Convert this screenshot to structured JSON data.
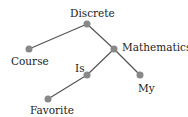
{
  "diagram": {
    "type": "tree",
    "edge_color": "#555555",
    "node_color": "#888888",
    "nodes": [
      {
        "id": "discrete",
        "label": "Discrete",
        "x": 87,
        "y": 24
      },
      {
        "id": "course",
        "label": "Course",
        "x": 29,
        "y": 49
      },
      {
        "id": "mathematics",
        "label": "Mathematics",
        "x": 114,
        "y": 49
      },
      {
        "id": "is",
        "label": "Is",
        "x": 87,
        "y": 75
      },
      {
        "id": "my",
        "label": "My",
        "x": 140,
        "y": 75
      },
      {
        "id": "favorite",
        "label": "Favorite",
        "x": 48,
        "y": 99
      }
    ],
    "edges": [
      [
        "discrete",
        "course"
      ],
      [
        "discrete",
        "mathematics"
      ],
      [
        "mathematics",
        "is"
      ],
      [
        "mathematics",
        "my"
      ],
      [
        "is",
        "favorite"
      ]
    ]
  }
}
